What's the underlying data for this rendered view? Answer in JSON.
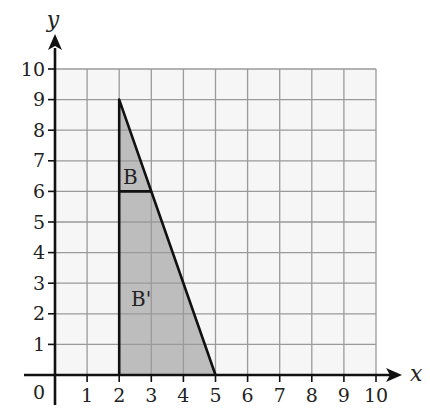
{
  "diagram": {
    "type": "coordinate-grid",
    "axes": {
      "x_label": "x",
      "y_label": "y",
      "origin_label": "0",
      "x_ticks": [
        "1",
        "2",
        "3",
        "4",
        "5",
        "6",
        "7",
        "8",
        "9",
        "10"
      ],
      "y_ticks": [
        "1",
        "2",
        "3",
        "4",
        "5",
        "6",
        "7",
        "8",
        "9",
        "10"
      ],
      "x_range": [
        0,
        10
      ],
      "y_range": [
        0,
        10
      ]
    },
    "shapes": [
      {
        "label": "B",
        "description": "small triangle",
        "vertices": [
          [
            2,
            6
          ],
          [
            2,
            9
          ],
          [
            3,
            6
          ]
        ]
      },
      {
        "label": "B'",
        "description": "enlarged triangle (image of B)",
        "vertices": [
          [
            2,
            0
          ],
          [
            2,
            9
          ],
          [
            5,
            0
          ]
        ]
      }
    ],
    "colors": {
      "grid_background": "#f6f6f6",
      "grid_line": "#9a9a9a",
      "shape_fill": "#bdbdbd",
      "axis": "#111111"
    }
  }
}
